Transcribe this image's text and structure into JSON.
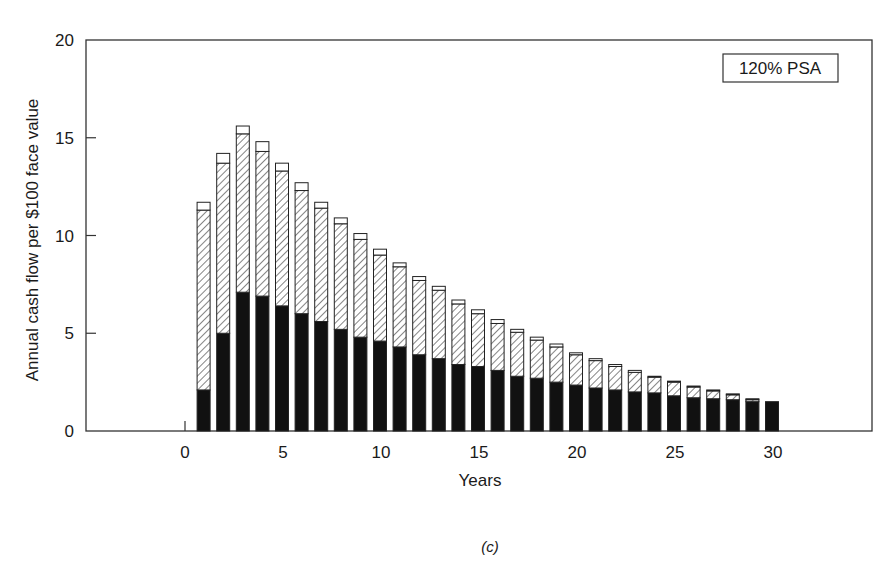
{
  "chart_data": {
    "type": "bar",
    "stacked": true,
    "title": "",
    "legend_label": "120% PSA",
    "legend_position": "top-right",
    "xlabel": "Years",
    "ylabel": "Annual cash flow per $100 face value",
    "caption": "(c)",
    "xlim": [
      -9,
      35
    ],
    "ylim": [
      0,
      20
    ],
    "xticks": [
      0,
      5,
      10,
      15,
      20,
      25,
      30
    ],
    "yticks": [
      0,
      5,
      10,
      15,
      20
    ],
    "grid": false,
    "categories": [
      1,
      2,
      3,
      4,
      5,
      6,
      7,
      8,
      9,
      10,
      11,
      12,
      13,
      14,
      15,
      16,
      17,
      18,
      19,
      20,
      21,
      22,
      23,
      24,
      25,
      26,
      27,
      28,
      29,
      30
    ],
    "series": [
      {
        "name": "black (solid) segment",
        "fill": "#111111",
        "values": [
          2.1,
          5.0,
          7.1,
          6.9,
          6.4,
          6.0,
          5.6,
          5.2,
          4.8,
          4.6,
          4.3,
          3.9,
          3.7,
          3.4,
          3.3,
          3.1,
          2.8,
          2.7,
          2.5,
          2.35,
          2.2,
          2.1,
          2.0,
          1.95,
          1.8,
          1.7,
          1.65,
          1.6,
          1.5,
          1.5
        ]
      },
      {
        "name": "hatched segment",
        "fill": "hatched",
        "values": [
          9.2,
          8.7,
          8.1,
          7.4,
          6.9,
          6.3,
          5.8,
          5.4,
          5.0,
          4.4,
          4.1,
          3.8,
          3.5,
          3.1,
          2.7,
          2.4,
          2.25,
          1.95,
          1.8,
          1.55,
          1.4,
          1.2,
          1.0,
          0.8,
          0.7,
          0.55,
          0.4,
          0.25,
          0.1,
          0.0
        ]
      },
      {
        "name": "white (open) segment",
        "fill": "#ffffff",
        "values": [
          0.4,
          0.5,
          0.4,
          0.5,
          0.4,
          0.4,
          0.3,
          0.3,
          0.3,
          0.3,
          0.2,
          0.2,
          0.2,
          0.2,
          0.2,
          0.2,
          0.15,
          0.15,
          0.15,
          0.1,
          0.1,
          0.1,
          0.1,
          0.05,
          0.05,
          0.05,
          0.05,
          0.05,
          0.05,
          0.0
        ]
      }
    ],
    "totals": [
      11.7,
      14.2,
      15.6,
      14.8,
      13.7,
      12.7,
      11.7,
      10.9,
      10.1,
      9.3,
      8.6,
      7.9,
      7.4,
      6.7,
      6.2,
      5.7,
      5.2,
      4.8,
      4.45,
      4.0,
      3.7,
      3.4,
      3.1,
      2.8,
      2.55,
      2.3,
      2.1,
      1.9,
      1.65,
      1.5
    ]
  }
}
